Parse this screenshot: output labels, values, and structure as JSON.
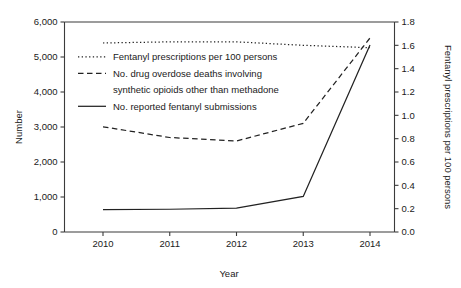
{
  "chart_data": {
    "type": "line",
    "title": "",
    "xlabel": "Year",
    "ylabel": "Number",
    "y2label": "Fentanyl prescriptions per 100 persons",
    "x": [
      2010,
      2011,
      2012,
      2013,
      2014
    ],
    "xticklabels": [
      "2010",
      "2011",
      "2012",
      "2013",
      "2014"
    ],
    "xlim": [
      2010,
      2014
    ],
    "ylim": [
      0,
      6000
    ],
    "yticks": [
      0,
      1000,
      2000,
      3000,
      4000,
      5000,
      6000
    ],
    "yticklabels": [
      "0",
      "1,000",
      "2,000",
      "3,000",
      "4,000",
      "5,000",
      "6,000"
    ],
    "y2lim": [
      0.0,
      1.8
    ],
    "y2ticks": [
      0.0,
      0.2,
      0.4,
      0.6,
      0.8,
      1.0,
      1.2,
      1.4,
      1.6,
      1.8
    ],
    "y2ticklabels": [
      "0.0",
      "0.2",
      "0.4",
      "0.6",
      "0.8",
      "1.0",
      "1.2",
      "1.4",
      "1.6",
      "1.8"
    ],
    "grid": false,
    "legend_position": "upper-left-inside",
    "series": [
      {
        "name": "Fentanyl prescriptions per 100 persons",
        "style": "dotted",
        "axis": "right",
        "values": [
          1.62,
          1.63,
          1.63,
          1.6,
          1.58
        ]
      },
      {
        "name": "No. drug overdose deaths involving synthetic opioids other than methadone",
        "style": "dashed",
        "axis": "left",
        "values": [
          3007,
          2700,
          2600,
          3105,
          5544
        ]
      },
      {
        "name": "No. reported fentanyl submissions",
        "style": "solid",
        "axis": "left",
        "values": [
          640,
          650,
          685,
          1015,
          5343
        ]
      }
    ]
  },
  "legend": {
    "items": [
      {
        "label": "Fentanyl prescriptions per 100 persons",
        "style": "dotted"
      },
      {
        "label": "No. drug overdose deaths involving",
        "style": "dashed"
      },
      {
        "label": "synthetic opioids other than methadone",
        "style": "none"
      },
      {
        "label": "No. reported fentanyl submissions",
        "style": "solid"
      }
    ]
  },
  "colors": {
    "line": "#222222",
    "axis": "#3b3b3b",
    "text": "#1a1a1a",
    "background": "#ffffff"
  }
}
